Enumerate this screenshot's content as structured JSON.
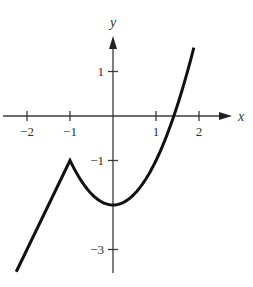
{
  "chart_data": {
    "type": "line",
    "title": "",
    "xlabel": "x",
    "ylabel": "y",
    "xlim": [
      -2.5,
      2.75
    ],
    "ylim": [
      -3.6,
      2.0
    ],
    "grid": false,
    "legend": null,
    "x_ticks": [
      {
        "value": -2,
        "label": "−2"
      },
      {
        "value": -1,
        "label": "−1"
      },
      {
        "value": 1,
        "label": "1"
      },
      {
        "value": 2,
        "label": "2"
      }
    ],
    "y_ticks": [
      {
        "value": 1,
        "label": "1"
      },
      {
        "value": -1,
        "label": "−1"
      },
      {
        "value": -3,
        "label": "−3"
      }
    ],
    "series": [
      {
        "name": "f(x) piecewise: linear for x <= -1",
        "description": "y = 2x + 1",
        "x": [
          -2.25,
          -2.0,
          -1.5,
          -1.0
        ],
        "y": [
          -3.5,
          -3.0,
          -2.0,
          -1.0
        ]
      },
      {
        "name": "f(x) piecewise: parabola for x >= -1",
        "description": "y = x^2 - 2",
        "x": [
          -1.0,
          -0.75,
          -0.5,
          -0.25,
          0.0,
          0.25,
          0.5,
          0.75,
          1.0,
          1.25,
          1.414,
          1.6,
          1.75,
          1.88
        ],
        "y": [
          -1.0,
          -1.44,
          -1.75,
          -1.94,
          -2.0,
          -1.94,
          -1.75,
          -1.44,
          -1.0,
          -0.44,
          0.0,
          0.56,
          1.06,
          1.53
        ]
      }
    ],
    "annotations": [
      {
        "type": "corner",
        "x": -1,
        "y": -1
      },
      {
        "type": "minimum",
        "x": 0,
        "y": -2
      },
      {
        "type": "x-intercept",
        "x": 1.414,
        "y": 0
      }
    ]
  },
  "layout": {
    "origin_px": [
      113,
      116
    ],
    "x_unit_px": 43,
    "y_unit_px": 44.5,
    "x_axis_px": [
      3,
      232
    ],
    "y_axis_px": [
      36,
      273
    ]
  }
}
